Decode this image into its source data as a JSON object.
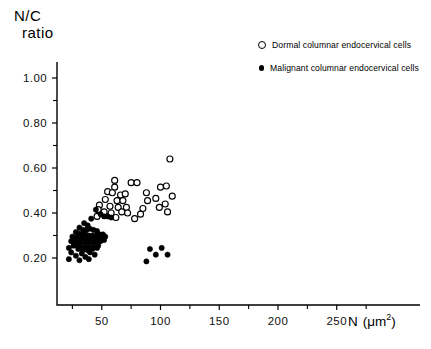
{
  "chart_data": {
    "type": "scatter",
    "title": "",
    "ylabel_line1": "N/C",
    "ylabel_line2": "ratio",
    "xlabel": "N (μm2)",
    "xlabel_main": "N",
    "xlabel_unit": "(μm",
    "xlabel_exponent": "2",
    "xlabel_close": ")",
    "xlim": [
      0,
      275
    ],
    "ylim": [
      0.1,
      1.1
    ],
    "grid": false,
    "legend_position": "top-right",
    "xticks": [
      50,
      100,
      150,
      200,
      250
    ],
    "xticklabels": [
      "50",
      "100",
      "150",
      "200",
      "250"
    ],
    "xminorticks": [
      25,
      75,
      125,
      175,
      225,
      275
    ],
    "yticks": [
      0.2,
      0.4,
      0.6,
      0.8,
      1.0
    ],
    "yticklabels": [
      "0.20",
      "0.40",
      "0.60",
      "0.80",
      "1.00"
    ],
    "yminorticks": [
      0.3,
      0.5,
      0.7,
      0.9,
      1.1
    ],
    "series": [
      {
        "name": "Dormal columnar endocervical cells",
        "marker": "open-circle",
        "color": "#000000",
        "points": [
          [
            108,
            0.64
          ],
          [
            61,
            0.545
          ],
          [
            61,
            0.515
          ],
          [
            75,
            0.535
          ],
          [
            80,
            0.535
          ],
          [
            100,
            0.515
          ],
          [
            105,
            0.52
          ],
          [
            55,
            0.495
          ],
          [
            59,
            0.49
          ],
          [
            66,
            0.48
          ],
          [
            70,
            0.485
          ],
          [
            88,
            0.49
          ],
          [
            96,
            0.465
          ],
          [
            110,
            0.475
          ],
          [
            53,
            0.46
          ],
          [
            63,
            0.455
          ],
          [
            68,
            0.455
          ],
          [
            89,
            0.455
          ],
          [
            104,
            0.44
          ],
          [
            48,
            0.435
          ],
          [
            57,
            0.43
          ],
          [
            64,
            0.425
          ],
          [
            71,
            0.425
          ],
          [
            85,
            0.42
          ],
          [
            99,
            0.425
          ],
          [
            47,
            0.415
          ],
          [
            52,
            0.405
          ],
          [
            58,
            0.4
          ],
          [
            67,
            0.405
          ],
          [
            72,
            0.4
          ],
          [
            83,
            0.395
          ],
          [
            106,
            0.405
          ],
          [
            46,
            0.385
          ],
          [
            62,
            0.38
          ],
          [
            78,
            0.375
          ]
        ]
      },
      {
        "name": "Malignant columnar endocervical cells",
        "marker": "filled-circle",
        "color": "#000000",
        "points": [
          [
            45,
            0.415
          ],
          [
            49,
            0.395
          ],
          [
            52,
            0.385
          ],
          [
            55,
            0.385
          ],
          [
            58,
            0.38
          ],
          [
            41,
            0.375
          ],
          [
            35,
            0.355
          ],
          [
            38,
            0.345
          ],
          [
            31,
            0.335
          ],
          [
            34,
            0.325
          ],
          [
            37,
            0.325
          ],
          [
            40,
            0.33
          ],
          [
            43,
            0.325
          ],
          [
            46,
            0.32
          ],
          [
            28,
            0.315
          ],
          [
            30,
            0.31
          ],
          [
            33,
            0.305
          ],
          [
            36,
            0.305
          ],
          [
            39,
            0.3
          ],
          [
            42,
            0.3
          ],
          [
            45,
            0.3
          ],
          [
            48,
            0.305
          ],
          [
            51,
            0.305
          ],
          [
            25,
            0.295
          ],
          [
            27,
            0.29
          ],
          [
            29,
            0.29
          ],
          [
            32,
            0.285
          ],
          [
            35,
            0.285
          ],
          [
            38,
            0.285
          ],
          [
            41,
            0.285
          ],
          [
            44,
            0.285
          ],
          [
            47,
            0.285
          ],
          [
            50,
            0.29
          ],
          [
            53,
            0.295
          ],
          [
            24,
            0.275
          ],
          [
            26,
            0.27
          ],
          [
            28,
            0.27
          ],
          [
            31,
            0.27
          ],
          [
            34,
            0.27
          ],
          [
            37,
            0.27
          ],
          [
            40,
            0.27
          ],
          [
            43,
            0.27
          ],
          [
            46,
            0.27
          ],
          [
            49,
            0.275
          ],
          [
            52,
            0.28
          ],
          [
            26,
            0.255
          ],
          [
            29,
            0.255
          ],
          [
            32,
            0.25
          ],
          [
            36,
            0.25
          ],
          [
            39,
            0.25
          ],
          [
            43,
            0.25
          ],
          [
            47,
            0.255
          ],
          [
            22,
            0.245
          ],
          [
            30,
            0.24
          ],
          [
            34,
            0.235
          ],
          [
            38,
            0.235
          ],
          [
            42,
            0.24
          ],
          [
            46,
            0.245
          ],
          [
            24,
            0.225
          ],
          [
            33,
            0.22
          ],
          [
            40,
            0.225
          ],
          [
            28,
            0.21
          ],
          [
            36,
            0.205
          ],
          [
            44,
            0.215
          ],
          [
            22,
            0.195
          ],
          [
            31,
            0.19
          ],
          [
            39,
            0.195
          ],
          [
            91,
            0.24
          ],
          [
            101,
            0.245
          ],
          [
            96,
            0.215
          ],
          [
            106,
            0.215
          ],
          [
            88,
            0.185
          ]
        ]
      }
    ]
  },
  "legend": {
    "entries": [
      {
        "label": "Dormal columnar endocervical cells",
        "marker": "open-circle"
      },
      {
        "label": "Malignant columnar endocervical cells",
        "marker": "filled-circle"
      }
    ]
  }
}
